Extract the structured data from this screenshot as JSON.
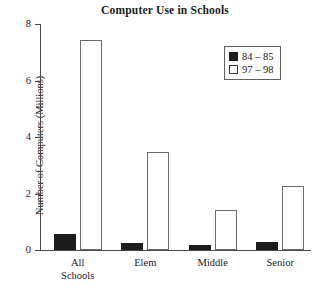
{
  "chart_data": {
    "type": "bar",
    "title": "Computer Use in Schools",
    "xlabel": "",
    "ylabel": "Number of Computers (Millions)",
    "categories": [
      "All\nSchools",
      "Elem",
      "Middle",
      "Senior"
    ],
    "series": [
      {
        "name": "84 – 85",
        "color": "#1b1b1b",
        "fill": "solid",
        "values": [
          0.57,
          0.25,
          0.17,
          0.27
        ]
      },
      {
        "name": "97 – 98",
        "color": "#ffffff",
        "fill": "hollow",
        "values": [
          7.42,
          3.47,
          1.4,
          2.25
        ]
      }
    ],
    "ylim": [
      0,
      8
    ],
    "yticks": [
      0,
      2,
      4,
      6,
      8
    ],
    "ytick_labels": [
      "0",
      "2",
      "4",
      "6",
      "8"
    ],
    "grid": false,
    "legend_position": "upper right",
    "legend_entries": [
      "84 – 85",
      "97 – 98"
    ]
  },
  "legend": {
    "items": [
      {
        "label": "84 – 85",
        "swatch": "filled-square-icon"
      },
      {
        "label": "97 – 98",
        "swatch": "hollow-square-icon"
      }
    ]
  }
}
